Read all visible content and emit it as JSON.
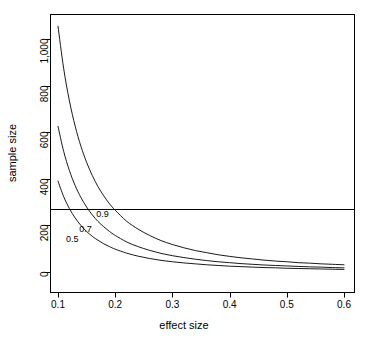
{
  "chart_data": {
    "type": "line",
    "title": "",
    "xlabel": "effect size",
    "ylabel": "sample size",
    "xlim": [
      0.1,
      0.6
    ],
    "ylim": [
      0,
      1100
    ],
    "grid": false,
    "legend": "inline-curve-labels",
    "x_ticks": [
      0.1,
      0.2,
      0.3,
      0.4,
      0.5,
      0.6
    ],
    "x_tick_labels": [
      "0.1",
      "0.2",
      "0.3",
      "0.4",
      "0.5",
      "0.6"
    ],
    "y_ticks": [
      0,
      200,
      400,
      600,
      800,
      1000
    ],
    "y_tick_labels": [
      "0",
      "200",
      "400",
      "600",
      "800",
      "1,000"
    ],
    "annotations": [
      {
        "text": "0.5",
        "x": 0.125,
        "y": 140
      },
      {
        "text": "0.7",
        "x": 0.148,
        "y": 185
      },
      {
        "text": "0.9",
        "x": 0.178,
        "y": 250
      }
    ],
    "reference_line": {
      "orientation": "horizontal",
      "y": 270,
      "label": ""
    },
    "x": [
      0.1,
      0.11,
      0.12,
      0.13,
      0.14,
      0.15,
      0.16,
      0.17,
      0.18,
      0.19,
      0.2,
      0.22,
      0.24,
      0.26,
      0.28,
      0.3,
      0.32,
      0.34,
      0.36,
      0.38,
      0.4,
      0.42,
      0.44,
      0.46,
      0.48,
      0.5,
      0.52,
      0.54,
      0.56,
      0.58,
      0.6
    ],
    "series": [
      {
        "name": "0.5",
        "label": "0.5",
        "values": [
          390,
          323,
          272,
          232,
          200,
          174,
          153,
          136,
          121,
          109,
          98,
          81,
          68,
          58,
          50,
          44,
          39,
          35,
          31,
          28,
          25,
          23,
          21,
          19,
          18,
          16,
          15,
          14,
          13,
          12,
          11
        ]
      },
      {
        "name": "0.7",
        "label": "0.7",
        "values": [
          625,
          517,
          435,
          371,
          320,
          279,
          245,
          217,
          194,
          174,
          157,
          129,
          109,
          93,
          80,
          70,
          62,
          55,
          49,
          44,
          40,
          36,
          33,
          30,
          28,
          26,
          24,
          22,
          21,
          19,
          18
        ]
      },
      {
        "name": "0.9",
        "label": "0.9",
        "values": [
          1055,
          872,
          734,
          626,
          540,
          471,
          414,
          366,
          327,
          293,
          265,
          218,
          184,
          157,
          135,
          118,
          104,
          92,
          83,
          74,
          67,
          61,
          56,
          51,
          47,
          44,
          40,
          38,
          35,
          33,
          31
        ]
      }
    ]
  },
  "axes": {
    "x_title": "effect size",
    "y_title": "sample size"
  }
}
